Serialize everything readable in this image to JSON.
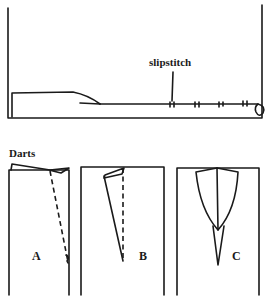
{
  "figure": {
    "hem_diagram": {
      "callout_label": "slipstitch"
    },
    "darts_section": {
      "title": "Darts",
      "panels": [
        {
          "label": "A"
        },
        {
          "label": "B"
        },
        {
          "label": "C"
        }
      ]
    },
    "colors": {
      "line": "#1a1a1a",
      "background": "#ffffff"
    }
  }
}
